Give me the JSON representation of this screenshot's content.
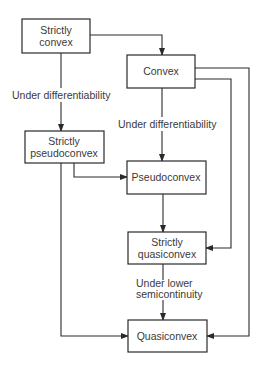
{
  "diagram": {
    "type": "flowchart",
    "nodes": {
      "strictly_convex": {
        "lines": [
          "Strictly",
          "convex"
        ]
      },
      "convex": {
        "lines": [
          "Convex"
        ]
      },
      "strictly_pseudoconvex": {
        "lines": [
          "Strictly",
          "pseudoconvex"
        ]
      },
      "pseudoconvex": {
        "lines": [
          "Pseudoconvex"
        ]
      },
      "strictly_quasiconvex": {
        "lines": [
          "Strictly",
          "quasiconvex"
        ]
      },
      "quasiconvex": {
        "lines": [
          "Quasiconvex"
        ]
      }
    },
    "edge_labels": {
      "left_differentiability": "Under differentiability",
      "center_differentiability": "Under differentiability",
      "lower_semicontinuity_line1": "Under lower",
      "lower_semicontinuity_line2": "semicontinuity"
    },
    "edges": [
      {
        "from": "strictly_convex",
        "to": "convex"
      },
      {
        "from": "strictly_convex",
        "to": "strictly_pseudoconvex",
        "label": "Under differentiability"
      },
      {
        "from": "convex",
        "to": "pseudoconvex",
        "label": "Under differentiability"
      },
      {
        "from": "convex",
        "to": "strictly_quasiconvex"
      },
      {
        "from": "convex",
        "to": "quasiconvex"
      },
      {
        "from": "strictly_pseudoconvex",
        "to": "pseudoconvex"
      },
      {
        "from": "strictly_pseudoconvex",
        "to": "quasiconvex"
      },
      {
        "from": "pseudoconvex",
        "to": "strictly_quasiconvex"
      },
      {
        "from": "strictly_quasiconvex",
        "to": "quasiconvex",
        "label": "Under lower semicontinuity"
      }
    ]
  }
}
